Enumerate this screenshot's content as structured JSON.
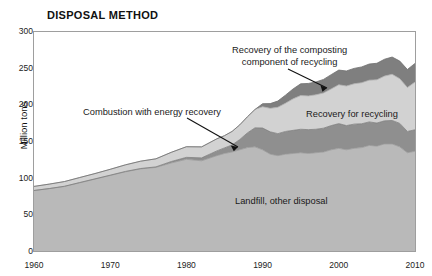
{
  "chart_data": {
    "type": "area",
    "title": "DISPOSAL METHOD",
    "subtitle": "",
    "xlabel": "",
    "ylabel": "Million tons",
    "xlim": [
      1960,
      2010
    ],
    "ylim": [
      0,
      300
    ],
    "grid": false,
    "legend_position": "inline-annotations",
    "stacked": true,
    "x_ticks": [
      1960,
      1970,
      1980,
      1990,
      2000,
      2010
    ],
    "x_tick_labels": [
      "1960",
      "1970",
      "1980",
      "1990",
      "2000",
      "2010"
    ],
    "y_ticks": [
      0,
      50,
      100,
      150,
      200,
      250,
      300
    ],
    "y_tick_labels": [
      "0",
      "50",
      "100",
      "150",
      "200",
      "250",
      "300"
    ],
    "x": [
      1960,
      1962,
      1964,
      1966,
      1968,
      1970,
      1972,
      1974,
      1976,
      1978,
      1980,
      1982,
      1984,
      1985,
      1986,
      1987,
      1988,
      1989,
      1990,
      1991,
      1992,
      1993,
      1994,
      1995,
      1996,
      1997,
      1998,
      1999,
      2000,
      2001,
      2002,
      2003,
      2004,
      2005,
      2006,
      2007,
      2008,
      2009,
      2010
    ],
    "series": [
      {
        "name": "Landfill, other disposal",
        "color": "#b9b9b9",
        "values": [
          82.5,
          85.0,
          88.0,
          93.0,
          98.0,
          103.0,
          108.0,
          112.0,
          114.0,
          120.0,
          125.0,
          123.0,
          130.0,
          133.0,
          135.0,
          138.0,
          141.0,
          142.0,
          138.0,
          132.0,
          130.0,
          132.0,
          133.0,
          134.0,
          133.0,
          134.0,
          135.0,
          138.0,
          140.0,
          138.0,
          140.0,
          141.0,
          144.0,
          143.0,
          146.0,
          146.0,
          142.0,
          134.0,
          136.0
        ]
      },
      {
        "name": "Combustion with energy recovery",
        "color": "#8f8f8f",
        "values": [
          0.0,
          0.2,
          0.3,
          0.4,
          0.4,
          0.4,
          0.5,
          0.5,
          0.7,
          2.0,
          2.7,
          4.0,
          6.5,
          7.6,
          9.6,
          14.0,
          20.0,
          26.0,
          29.7,
          30.5,
          30.0,
          31.0,
          31.5,
          32.0,
          32.5,
          32.0,
          32.5,
          33.0,
          33.7,
          33.0,
          33.0,
          32.5,
          32.0,
          31.5,
          31.5,
          32.0,
          32.0,
          29.0,
          29.3
        ]
      },
      {
        "name": "Recovery for recycling",
        "color": "#d2d2d2",
        "values": [
          5.6,
          6.0,
          6.4,
          6.8,
          7.2,
          8.0,
          9.0,
          10.0,
          11.0,
          12.5,
          14.5,
          15.0,
          16.5,
          16.7,
          18.5,
          20.0,
          22.0,
          25.0,
          29.0,
          32.0,
          36.0,
          38.5,
          43.0,
          46.0,
          46.0,
          47.0,
          48.0,
          50.0,
          53.0,
          54.0,
          55.0,
          56.0,
          57.0,
          59.0,
          61.0,
          63.0,
          61.0,
          60.0,
          65.0
        ]
      },
      {
        "name": "Recovery of the composting component of recycling",
        "color": "#7f7f7f",
        "values": [
          0.0,
          0.0,
          0.0,
          0.0,
          0.0,
          0.0,
          0.0,
          0.0,
          0.0,
          0.0,
          0.0,
          0.0,
          0.0,
          0.0,
          0.0,
          0.0,
          0.0,
          0.0,
          4.2,
          6.5,
          8.5,
          11.0,
          13.5,
          16.0,
          17.0,
          17.5,
          18.5,
          19.5,
          20.0,
          20.5,
          21.0,
          21.5,
          22.0,
          22.5,
          23.0,
          23.5,
          24.0,
          24.5,
          25.5
        ]
      }
    ],
    "annotations": [
      {
        "id": "composting",
        "text_lines": [
          "Recovery of the composting",
          "component of recycling"
        ]
      },
      {
        "id": "combustion",
        "text_lines": [
          "Combustion with energy recovery"
        ]
      },
      {
        "id": "recycling",
        "text_lines": [
          "Recovery for recycling"
        ]
      },
      {
        "id": "landfill",
        "text_lines": [
          "Landfill, other disposal"
        ]
      }
    ],
    "colors": {
      "landfill": "#b9b9b9",
      "combustion": "#8f8f8f",
      "recycling": "#d2d2d2",
      "composting": "#7f7f7f",
      "axis": "#999999",
      "text": "#111111",
      "background": "#ffffff"
    }
  }
}
